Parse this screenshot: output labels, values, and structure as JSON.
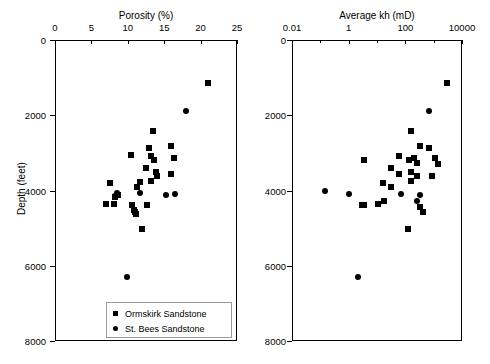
{
  "figure": {
    "ylabel": "Depth (feet)",
    "y_ticks": [
      {
        "label": "0",
        "value": 0
      },
      {
        "label": "2000",
        "value": 2000
      },
      {
        "label": "4000",
        "value": 4000
      },
      {
        "label": "6000",
        "value": 6000
      },
      {
        "label": "8000",
        "value": 8000
      }
    ],
    "legend": {
      "items": [
        {
          "label": "Ormskirk Sandstone",
          "marker": "square"
        },
        {
          "label": "St. Bees Sandstone",
          "marker": "circle"
        }
      ]
    }
  },
  "chart_data": [
    {
      "type": "scatter",
      "title": "Porosity (%)",
      "xlabel": "Porosity (%)",
      "ylabel": "Depth (feet)",
      "xscale": "linear",
      "xlim": [
        0,
        25
      ],
      "ylim": [
        8000,
        0
      ],
      "y_inverted": true,
      "grid": false,
      "x_ticks": [
        0,
        5,
        10,
        15,
        20,
        25
      ],
      "x_tick_labels": [
        "0",
        "5",
        "10",
        "15",
        "20",
        "25"
      ],
      "y_ticks": [
        0,
        2000,
        4000,
        6000,
        8000
      ],
      "y_tick_labels": [
        "0",
        "2000",
        "4000",
        "6000",
        "8000"
      ],
      "legend_position": "bottom-center",
      "series": [
        {
          "name": "Ormskirk Sandstone",
          "marker": "square",
          "color": "#000000",
          "points": [
            [
              21.0,
              1150
            ],
            [
              13.4,
              2430
            ],
            [
              12.9,
              2870
            ],
            [
              15.9,
              2810
            ],
            [
              10.4,
              3060
            ],
            [
              13.2,
              3070
            ],
            [
              13.6,
              3180
            ],
            [
              16.4,
              3130
            ],
            [
              12.5,
              3400
            ],
            [
              13.9,
              3520
            ],
            [
              14.0,
              3620
            ],
            [
              16.0,
              3570
            ],
            [
              7.6,
              3800
            ],
            [
              11.7,
              3780
            ],
            [
              13.2,
              3760
            ],
            [
              11.3,
              3920
            ],
            [
              8.6,
              4130
            ],
            [
              8.2,
              4180
            ],
            [
              7.0,
              4360
            ],
            [
              8.1,
              4350
            ],
            [
              10.6,
              4380
            ],
            [
              12.7,
              4380
            ],
            [
              10.9,
              4510
            ],
            [
              11.0,
              4580
            ],
            [
              11.1,
              4620
            ],
            [
              12.0,
              5030
            ]
          ]
        },
        {
          "name": "St. Bees Sandstone",
          "marker": "circle",
          "color": "#000000",
          "points": [
            [
              18.0,
              1900
            ],
            [
              11.7,
              4060
            ],
            [
              15.2,
              4120
            ],
            [
              16.5,
              4100
            ],
            [
              8.5,
              4070
            ],
            [
              8.3,
              4140
            ],
            [
              9.9,
              6300
            ]
          ]
        }
      ]
    },
    {
      "type": "scatter",
      "title": "Average kh (mD)",
      "xlabel": "Average kh (mD)",
      "ylabel": "Depth (feet)",
      "xscale": "log",
      "xlim": [
        0.01,
        10000
      ],
      "ylim": [
        8000,
        0
      ],
      "y_inverted": true,
      "grid": false,
      "x_ticks": [
        0.01,
        1,
        100,
        10000
      ],
      "x_tick_labels": [
        "0.01",
        "1",
        "100",
        "10000"
      ],
      "x_minor_ticks": [
        0.1,
        10,
        1000
      ],
      "y_ticks": [
        0,
        2000,
        4000,
        6000,
        8000
      ],
      "y_tick_labels": [
        "0",
        "2000",
        "4000",
        "6000",
        "8000"
      ],
      "legend_position": "none",
      "series": [
        {
          "name": "Ormskirk Sandstone",
          "marker": "square",
          "color": "#000000",
          "points": [
            [
              3000,
              1150
            ],
            [
              160,
              2430
            ],
            [
              330,
              2810
            ],
            [
              700,
              2870
            ],
            [
              60,
              3070
            ],
            [
              200,
              3130
            ],
            [
              1100,
              3130
            ],
            [
              3.5,
              3180
            ],
            [
              130,
              3180
            ],
            [
              250,
              3280
            ],
            [
              1400,
              3290
            ],
            [
              30,
              3400
            ],
            [
              160,
              3520
            ],
            [
              60,
              3560
            ],
            [
              250,
              3620
            ],
            [
              900,
              3620
            ],
            [
              160,
              3760
            ],
            [
              16,
              3800
            ],
            [
              30,
              3920
            ],
            [
              18,
              4290
            ],
            [
              3.0,
              4380
            ],
            [
              3.6,
              4380
            ],
            [
              11,
              4360
            ],
            [
              330,
              4430
            ],
            [
              430,
              4560
            ],
            [
              120,
              5030
            ]
          ]
        },
        {
          "name": "St. Bees Sandstone",
          "marker": "circle",
          "color": "#000000",
          "points": [
            [
              700,
              1900
            ],
            [
              0.15,
              4020
            ],
            [
              1.0,
              4090
            ],
            [
              70,
              4080
            ],
            [
              330,
              4120
            ],
            [
              260,
              4280
            ],
            [
              2.2,
              6300
            ]
          ]
        }
      ]
    }
  ]
}
